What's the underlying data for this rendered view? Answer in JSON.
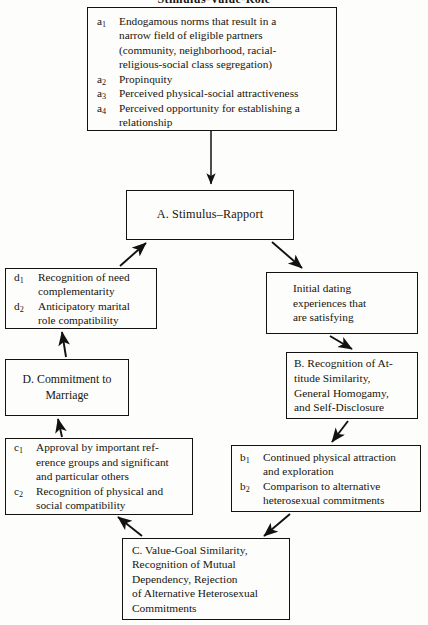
{
  "title": "Stimulus-Value-Role",
  "colors": {
    "ink": "#141210",
    "paper": "#fdfdfb",
    "border": "#141210"
  },
  "diagram": {
    "type": "flowchart",
    "orientation": "vertical-cycle",
    "boxes": {
      "a": {
        "name": "stimulus-factors-box",
        "items": [
          {
            "label": "a",
            "sub": "1",
            "lines": [
              "Endogamous norms that result in a",
              "narrow field of eligible partners",
              "(community, neighborhood, racial-",
              "religious-social class segregation)"
            ]
          },
          {
            "label": "a",
            "sub": "2",
            "lines": [
              "Propinquity"
            ]
          },
          {
            "label": "a",
            "sub": "3",
            "lines": [
              "Perceived physical-social attractiveness"
            ]
          },
          {
            "label": "a",
            "sub": "4",
            "lines": [
              "Perceived opportunity for establishing a",
              "relationship"
            ]
          }
        ]
      },
      "A": {
        "name": "stage-a-box",
        "lines": [
          "A.  Stimulus–Rapport"
        ]
      },
      "d": {
        "name": "need-complementarity-box",
        "items": [
          {
            "label": "d",
            "sub": "1",
            "lines": [
              "Recognition of need",
              "complementarity"
            ]
          },
          {
            "label": "d",
            "sub": "2",
            "lines": [
              "Anticipatory marital",
              "role compatibility"
            ]
          }
        ]
      },
      "initial_dating": {
        "name": "initial-dating-box",
        "lines": [
          "Initial dating",
          "experiences that",
          "are satisfying"
        ]
      },
      "B": {
        "name": "stage-b-box",
        "lines": [
          "B. Recognition of At-",
          "titude Similarity,",
          "General Homogamy,",
          "and Self-Disclosure"
        ]
      },
      "D": {
        "name": "stage-d-box",
        "lines": [
          "D. Commitment to",
          "Marriage"
        ]
      },
      "c": {
        "name": "social-approval-box",
        "items": [
          {
            "label": "c",
            "sub": "1",
            "lines": [
              "Approval by important ref-",
              "erence groups and significant",
              "and particular others"
            ]
          },
          {
            "label": "c",
            "sub": "2",
            "lines": [
              "Recognition of physical and",
              "social compatibility"
            ]
          }
        ]
      },
      "b": {
        "name": "physical-attraction-box",
        "items": [
          {
            "label": "b",
            "sub": "1",
            "lines": [
              "Continued physical attraction",
              "and exploration"
            ]
          },
          {
            "label": "b",
            "sub": "2",
            "lines": [
              "Comparison to alternative",
              "heterosexual commitments"
            ]
          }
        ]
      },
      "C": {
        "name": "stage-c-box",
        "lines": [
          "C.  Value-Goal Similarity,",
          "Recognition of Mutual",
          "Dependency, Rejection",
          "of Alternative Heterosexual",
          "Commitments"
        ]
      }
    },
    "arrows": [
      {
        "name": "arrow-a-to-A",
        "from": "a",
        "to": "A",
        "style": "straight-vertical",
        "direction": "down"
      },
      {
        "name": "arrow-d-to-A",
        "from": "d",
        "to": "A",
        "style": "diagonal",
        "direction": "up-right"
      },
      {
        "name": "arrow-A-to-initial-dating",
        "from": "A",
        "to": "initial_dating",
        "style": "diagonal",
        "direction": "down-right"
      },
      {
        "name": "arrow-initial-dating-to-B",
        "from": "initial_dating",
        "to": "B",
        "style": "diagonal",
        "direction": "down-right"
      },
      {
        "name": "arrow-B-to-b",
        "from": "B",
        "to": "b",
        "style": "diagonal",
        "direction": "down-left"
      },
      {
        "name": "arrow-b-to-C",
        "from": "b",
        "to": "C",
        "style": "diagonal",
        "direction": "down-left"
      },
      {
        "name": "arrow-C-to-c",
        "from": "C",
        "to": "c",
        "style": "diagonal",
        "direction": "up-left"
      },
      {
        "name": "arrow-c-to-D",
        "from": "c",
        "to": "D",
        "style": "diagonal",
        "direction": "up"
      },
      {
        "name": "arrow-D-to-d",
        "from": "D",
        "to": "d",
        "style": "diagonal",
        "direction": "up"
      }
    ]
  }
}
